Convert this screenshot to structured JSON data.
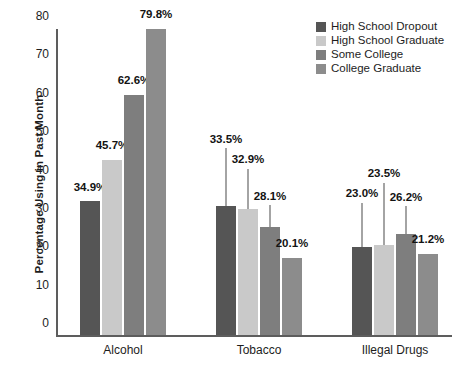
{
  "chart_data": {
    "type": "bar",
    "title": "",
    "xlabel": "",
    "ylabel": "Percentage Using in Past Month",
    "categories": [
      "Alcohol",
      "Tobacco",
      "Illegal Drugs"
    ],
    "ylim": [
      0,
      80
    ],
    "yticks": [
      0,
      10,
      20,
      30,
      40,
      50,
      60,
      70,
      80
    ],
    "ytick_labels": [
      "0",
      "10",
      "20",
      "30",
      "40",
      "50",
      "60",
      "70",
      "80"
    ],
    "grid": false,
    "legend_position": "top-right",
    "value_suffix": "%",
    "series": [
      {
        "name": "High School Dropout",
        "color": "#555555",
        "values": [
          34.9,
          33.5,
          23.0
        ],
        "labels": [
          "34.9%",
          "33.5%",
          "23.0%"
        ]
      },
      {
        "name": "High School Graduate",
        "color": "#c9c9c9",
        "values": [
          45.7,
          32.9,
          23.5
        ],
        "labels": [
          "45.7%",
          "32.9%",
          "23.5%"
        ]
      },
      {
        "name": "Some College",
        "color": "#7e7e7e",
        "values": [
          62.6,
          28.1,
          26.2
        ],
        "labels": [
          "62.6%",
          "28.1%",
          "26.2%"
        ]
      },
      {
        "name": "College Graduate",
        "color": "#8c8c8c",
        "values": [
          79.8,
          20.1,
          21.2
        ],
        "labels": [
          "79.8%",
          "20.1%",
          "21.2%"
        ]
      }
    ]
  },
  "axis": {
    "y_title": "Percentage Using in Past Month"
  },
  "legend": {
    "items": [
      {
        "label": "High School Dropout",
        "color": "#555555"
      },
      {
        "label": "High School Graduate",
        "color": "#c9c9c9"
      },
      {
        "label": "Some College",
        "color": "#7e7e7e"
      },
      {
        "label": "College Graduate",
        "color": "#8c8c8c"
      }
    ]
  }
}
